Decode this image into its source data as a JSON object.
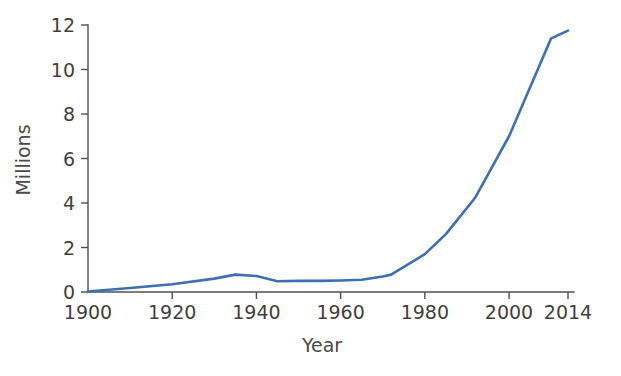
{
  "chart_data": {
    "type": "line",
    "title": "",
    "xlabel": "Year",
    "ylabel": "Millions",
    "xlim": [
      1900,
      2014
    ],
    "ylim": [
      0,
      12
    ],
    "grid": false,
    "legend": false,
    "line_color": "#3C6FB4",
    "axis_color": "#4f4f4f",
    "text_color": "#3f3f3f",
    "x_ticks": [
      1900,
      1920,
      1940,
      1960,
      1980,
      2000,
      2014
    ],
    "x_tick_labels": [
      "1900",
      "1920",
      "1940",
      "1960",
      "1980",
      "2000",
      "2014"
    ],
    "y_ticks": [
      0,
      2,
      4,
      6,
      8,
      10,
      12
    ],
    "y_tick_labels": [
      "0",
      "2",
      "4",
      "6",
      "8",
      "10",
      "12"
    ],
    "series": [
      {
        "name": "Millions",
        "x": [
          1900,
          1910,
          1920,
          1930,
          1935,
          1940,
          1945,
          1950,
          1955,
          1960,
          1965,
          1970,
          1972,
          1980,
          1985,
          1992,
          2000,
          2010,
          2014
        ],
        "values": [
          0.02,
          0.18,
          0.35,
          0.6,
          0.78,
          0.72,
          0.48,
          0.5,
          0.5,
          0.52,
          0.55,
          0.7,
          0.78,
          1.7,
          2.6,
          4.25,
          7.0,
          11.4,
          11.75
        ]
      }
    ]
  }
}
